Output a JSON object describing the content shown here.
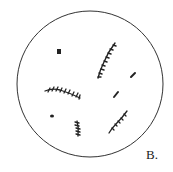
{
  "figure": {
    "label": "B.",
    "field_of_view": {
      "cx": 90,
      "cy": 84,
      "r": 73,
      "stroke": "#333333"
    },
    "ink_color": "#222222"
  }
}
